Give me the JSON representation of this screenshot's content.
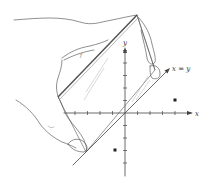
{
  "figure": {
    "colors": {
      "background": "#ffffff",
      "ink": "#444444",
      "light_ink": "#9a9a9a",
      "point": "#222222"
    },
    "axes": {
      "x_label": "x",
      "y_label": "y",
      "origin_px": [
        125,
        113
      ],
      "tick_spacing_px": 12.5,
      "x_ticks": [
        -4,
        -3,
        -2,
        -1,
        1,
        2,
        3,
        4,
        5
      ],
      "y_ticks": [
        -4,
        -3,
        -2,
        -1,
        1,
        2,
        3,
        4,
        5
      ]
    },
    "line": {
      "label": "x = y",
      "equation": "y = x"
    },
    "points": [
      {
        "name": "point-a",
        "x": 4,
        "y": 1
      },
      {
        "name": "point-b",
        "x": -1,
        "y": -3
      }
    ],
    "mirror_label": "f"
  }
}
